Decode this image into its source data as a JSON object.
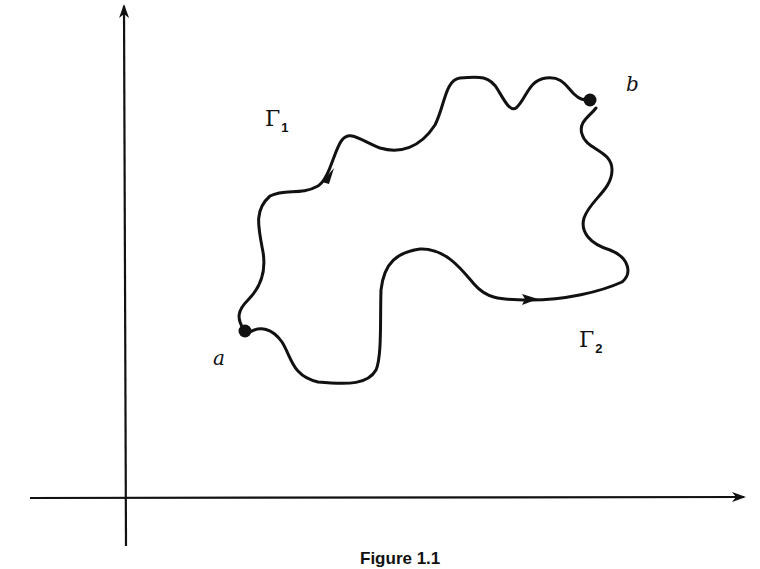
{
  "figure": {
    "caption": "Figure 1.1",
    "axes": {
      "x_axis": "horizontal axis with arrow",
      "y_axis": "vertical axis with arrow"
    },
    "points": [
      {
        "id": "a",
        "label": "a"
      },
      {
        "id": "b",
        "label": "b"
      }
    ],
    "paths": [
      {
        "id": "gamma1",
        "symbol": "Γ",
        "subscript": "1",
        "from": "a",
        "to": "b",
        "direction": "a to b (upper path)"
      },
      {
        "id": "gamma2",
        "symbol": "Γ",
        "subscript": "2",
        "from": "a",
        "to": "b",
        "direction": "a to b (lower path)"
      }
    ],
    "colors": {
      "ink": "#111111",
      "background": "#ffffff"
    }
  }
}
